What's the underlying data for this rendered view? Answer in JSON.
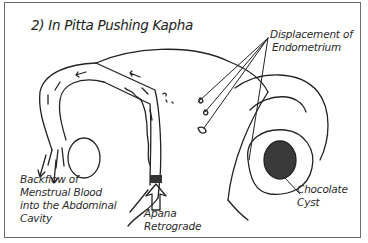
{
  "diagram": {
    "title": "2) In Pitta Pushing Kapha",
    "labels": {
      "displacement_line1": "Displacement of",
      "displacement_line2": "Endometrium",
      "backflow_line1": "Backflow of",
      "backflow_line2": "Menstrual Blood",
      "backflow_line3": "into the Abdominal",
      "backflow_line4": "Cavity",
      "apana_line1": "Apana",
      "apana_line2": "Retrograde",
      "cyst_line1": "Chocolate",
      "cyst_line2": "Cyst"
    },
    "colors": {
      "ink": "#222222",
      "cyst_fill": "#3a3a3a",
      "border": "#6d6d6d",
      "background": "#ffffff"
    }
  }
}
